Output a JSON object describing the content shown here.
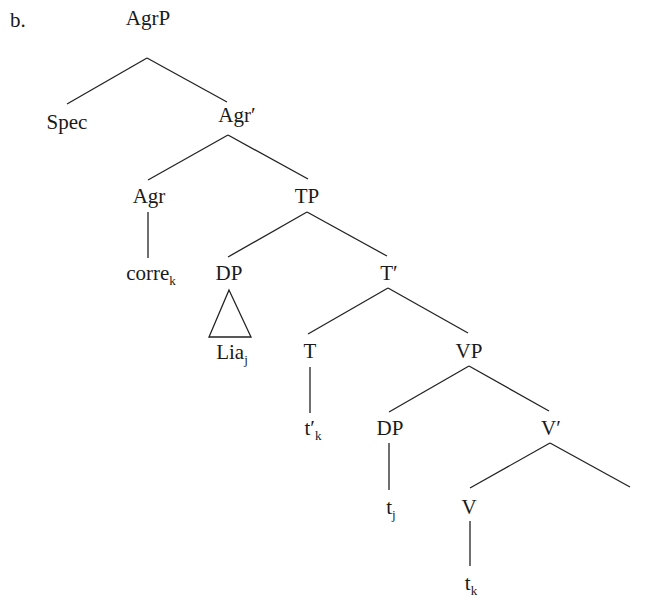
{
  "example_label": "b.",
  "nodes": {
    "agrp": {
      "text": "AgrP",
      "x": 148,
      "y": 8
    },
    "spec": {
      "text": "Spec",
      "x": 67,
      "y": 112
    },
    "agr_bar": {
      "text": "Agr′",
      "x": 237,
      "y": 105
    },
    "agr": {
      "text": "Agr",
      "x": 149,
      "y": 186
    },
    "tp": {
      "text": "TP",
      "x": 307,
      "y": 186
    },
    "corre": {
      "text": "corre",
      "sub": "k",
      "x": 151,
      "y": 263
    },
    "dp1": {
      "text": "DP",
      "x": 229,
      "y": 263
    },
    "t_bar": {
      "text": "T′",
      "x": 389,
      "y": 263
    },
    "lia": {
      "text": "Lia",
      "sub": "j",
      "x": 232,
      "y": 342
    },
    "t": {
      "text": "T",
      "x": 310,
      "y": 341
    },
    "vp": {
      "text": "VP",
      "x": 469,
      "y": 341
    },
    "t_prime_k": {
      "text": "t′",
      "sub": "k",
      "x": 313,
      "y": 418
    },
    "dp2": {
      "text": "DP",
      "x": 390,
      "y": 418
    },
    "v_bar": {
      "text": "V′",
      "x": 551,
      "y": 418
    },
    "t_j": {
      "text": "t",
      "sub": "j",
      "x": 391,
      "y": 497
    },
    "v": {
      "text": "V",
      "x": 469,
      "y": 497
    },
    "t_k": {
      "text": "t",
      "sub": "k",
      "x": 471,
      "y": 573
    }
  },
  "edges": [
    [
      "agrp",
      "spec"
    ],
    [
      "agrp",
      "agr_bar"
    ],
    [
      "agr_bar",
      "agr"
    ],
    [
      "agr_bar",
      "tp"
    ],
    [
      "agr",
      "corre"
    ],
    [
      "tp",
      "dp1"
    ],
    [
      "tp",
      "t_bar"
    ],
    [
      "t_bar",
      "t"
    ],
    [
      "t_bar",
      "vp"
    ],
    [
      "t",
      "t_prime_k"
    ],
    [
      "vp",
      "dp2"
    ],
    [
      "vp",
      "v_bar"
    ],
    [
      "v_bar",
      "v"
    ],
    [
      "v_bar",
      "empty_complement"
    ],
    [
      "dp2",
      "t_j"
    ],
    [
      "v",
      "t_k"
    ]
  ],
  "triangle": {
    "over": "lia",
    "under": "dp1"
  },
  "colors": {
    "ink": "#1a1a1a",
    "background": "#ffffff"
  }
}
